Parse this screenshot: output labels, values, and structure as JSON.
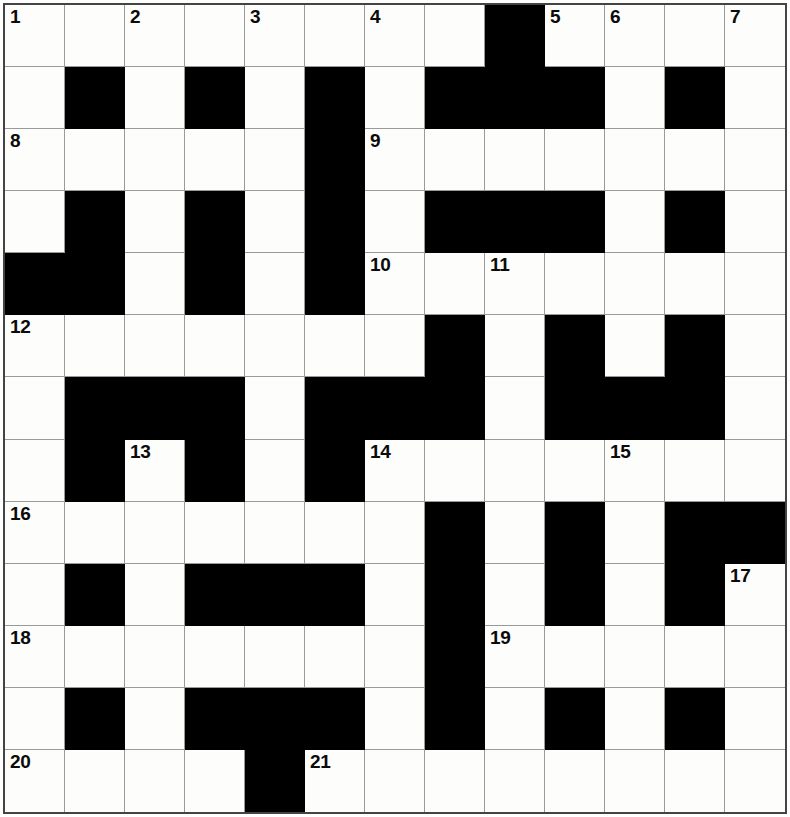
{
  "puzzle": {
    "type": "crossword-grid",
    "title": "Crossword Grid",
    "columns": 13,
    "rows": 13,
    "cell_size_px": 60,
    "colors": {
      "block": "#000000",
      "cell": "#fdfdfb",
      "gridline": "#9a9a9a",
      "border": "#444444",
      "number": "#0b0b0b"
    },
    "blocked_cells": [
      [
        1,
        9
      ],
      [
        2,
        2
      ],
      [
        2,
        4
      ],
      [
        2,
        6
      ],
      [
        2,
        8
      ],
      [
        2,
        9
      ],
      [
        2,
        10
      ],
      [
        2,
        12
      ],
      [
        3,
        6
      ],
      [
        4,
        2
      ],
      [
        4,
        4
      ],
      [
        4,
        6
      ],
      [
        4,
        8
      ],
      [
        4,
        9
      ],
      [
        4,
        10
      ],
      [
        4,
        12
      ],
      [
        5,
        1
      ],
      [
        5,
        2
      ],
      [
        5,
        4
      ],
      [
        5,
        6
      ],
      [
        6,
        8
      ],
      [
        6,
        10
      ],
      [
        6,
        12
      ],
      [
        7,
        2
      ],
      [
        7,
        3
      ],
      [
        7,
        4
      ],
      [
        7,
        6
      ],
      [
        7,
        7
      ],
      [
        7,
        8
      ],
      [
        7,
        10
      ],
      [
        7,
        11
      ],
      [
        7,
        12
      ],
      [
        8,
        2
      ],
      [
        8,
        4
      ],
      [
        8,
        6
      ],
      [
        9,
        8
      ],
      [
        9,
        10
      ],
      [
        9,
        12
      ],
      [
        9,
        13
      ],
      [
        10,
        2
      ],
      [
        10,
        4
      ],
      [
        10,
        5
      ],
      [
        10,
        6
      ],
      [
        10,
        8
      ],
      [
        10,
        10
      ],
      [
        10,
        12
      ],
      [
        11,
        8
      ],
      [
        12,
        2
      ],
      [
        12,
        4
      ],
      [
        12,
        5
      ],
      [
        12,
        6
      ],
      [
        12,
        8
      ],
      [
        12,
        10
      ],
      [
        12,
        12
      ],
      [
        13,
        5
      ]
    ],
    "numbered_cells": [
      {
        "number": "1",
        "row": 1,
        "col": 1
      },
      {
        "number": "2",
        "row": 1,
        "col": 3
      },
      {
        "number": "3",
        "row": 1,
        "col": 5
      },
      {
        "number": "4",
        "row": 1,
        "col": 7
      },
      {
        "number": "5",
        "row": 1,
        "col": 10
      },
      {
        "number": "6",
        "row": 1,
        "col": 11
      },
      {
        "number": "7",
        "row": 1,
        "col": 13
      },
      {
        "number": "8",
        "row": 3,
        "col": 1
      },
      {
        "number": "9",
        "row": 3,
        "col": 7
      },
      {
        "number": "10",
        "row": 5,
        "col": 7
      },
      {
        "number": "11",
        "row": 5,
        "col": 9
      },
      {
        "number": "12",
        "row": 6,
        "col": 1
      },
      {
        "number": "13",
        "row": 8,
        "col": 3
      },
      {
        "number": "14",
        "row": 8,
        "col": 7
      },
      {
        "number": "15",
        "row": 8,
        "col": 11
      },
      {
        "number": "16",
        "row": 9,
        "col": 1
      },
      {
        "number": "17",
        "row": 10,
        "col": 13
      },
      {
        "number": "18",
        "row": 11,
        "col": 1
      },
      {
        "number": "19",
        "row": 11,
        "col": 9
      },
      {
        "number": "20",
        "row": 13,
        "col": 1
      },
      {
        "number": "21",
        "row": 13,
        "col": 6
      }
    ]
  }
}
